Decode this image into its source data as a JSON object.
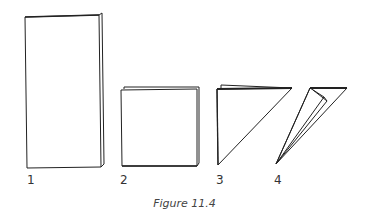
{
  "figure": {
    "caption": "Figure 11.4",
    "stroke_color": "#222222",
    "steps": [
      {
        "label": "1",
        "description": "tall folded rectangle (folded in half)"
      },
      {
        "label": "2",
        "description": "square (folded again)"
      },
      {
        "label": "3",
        "description": "right triangle (folded diagonally)"
      },
      {
        "label": "4",
        "description": "narrow triangular wedge (folded again)"
      }
    ]
  }
}
